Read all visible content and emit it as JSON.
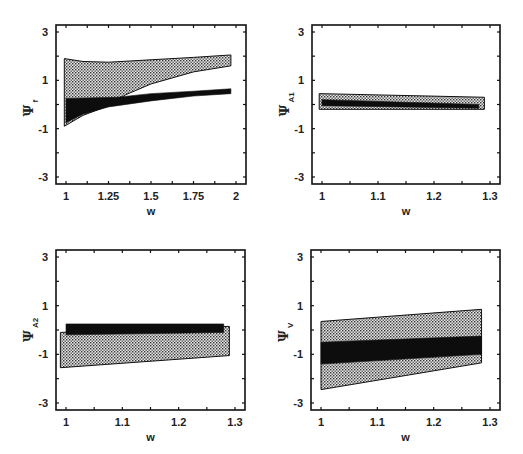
{
  "figure": {
    "panels": [
      {
        "id": "psi_f",
        "ylabel_main": "Ψ",
        "ylabel_sub": "f",
        "xlabel": "w"
      },
      {
        "id": "psi_A1",
        "ylabel_main": "Ψ",
        "ylabel_sub": "A1",
        "xlabel": "w"
      },
      {
        "id": "psi_A2",
        "ylabel_main": "Ψ",
        "ylabel_sub": "A2",
        "xlabel": "w"
      },
      {
        "id": "psi_V",
        "ylabel_main": "Ψ",
        "ylabel_sub": "V",
        "xlabel": "w"
      }
    ]
  },
  "chart_data": [
    {
      "type": "area",
      "title": "",
      "xlabel": "w",
      "ylabel": "Ψ_f",
      "xlim": [
        0.97,
        2.05
      ],
      "ylim": [
        -3.3,
        3.3
      ],
      "xticks": [
        1,
        1.25,
        1.5,
        1.75,
        2
      ],
      "xtick_labels": [
        "1",
        "1.25",
        "1.5",
        "1.75",
        "2"
      ],
      "yticks": [
        3,
        1,
        -1,
        -3
      ],
      "ytick_labels": [
        "3",
        "1",
        "-1",
        "-3"
      ],
      "grid": false,
      "series": [
        {
          "name": "hatched region (light)",
          "fill": "stippled",
          "upper": [
            [
              0.99,
              1.9
            ],
            [
              1.1,
              1.78
            ],
            [
              1.25,
              1.75
            ],
            [
              1.5,
              1.85
            ],
            [
              1.75,
              1.95
            ],
            [
              1.97,
              2.05
            ]
          ],
          "lower": [
            [
              0.99,
              -0.9
            ],
            [
              1.1,
              -0.45
            ],
            [
              1.25,
              -0.05
            ],
            [
              1.35,
              0.4
            ],
            [
              1.5,
              0.85
            ],
            [
              1.75,
              1.35
            ],
            [
              1.97,
              1.6
            ]
          ]
        },
        {
          "name": "dark region",
          "fill": "solid-black",
          "upper": [
            [
              1.0,
              0.25
            ],
            [
              1.3,
              0.3
            ],
            [
              1.5,
              0.45
            ],
            [
              1.75,
              0.55
            ],
            [
              1.97,
              0.65
            ]
          ],
          "lower": [
            [
              1.0,
              -0.75
            ],
            [
              1.1,
              -0.4
            ],
            [
              1.25,
              -0.1
            ],
            [
              1.5,
              0.15
            ],
            [
              1.75,
              0.35
            ],
            [
              1.97,
              0.45
            ]
          ]
        }
      ]
    },
    {
      "type": "area",
      "title": "",
      "xlabel": "w",
      "ylabel": "Ψ_A1",
      "xlim": [
        0.99,
        1.31
      ],
      "ylim": [
        -3.3,
        3.3
      ],
      "xticks": [
        1,
        1.1,
        1.2,
        1.3
      ],
      "xtick_labels": [
        "1",
        "1.1",
        "1.2",
        "1.3"
      ],
      "yticks": [
        3,
        1,
        -1,
        -3
      ],
      "ytick_labels": [
        "3",
        "1",
        "-1",
        "-3"
      ],
      "grid": false,
      "series": [
        {
          "name": "hatched region (light)",
          "fill": "stippled",
          "upper": [
            [
              0.995,
              0.45
            ],
            [
              1.29,
              0.3
            ]
          ],
          "lower": [
            [
              0.995,
              -0.2
            ],
            [
              1.29,
              -0.2
            ]
          ]
        },
        {
          "name": "dark region",
          "fill": "solid-black",
          "upper": [
            [
              1.0,
              0.2
            ],
            [
              1.28,
              0.0
            ]
          ],
          "lower": [
            [
              1.0,
              -0.05
            ],
            [
              1.28,
              -0.15
            ]
          ]
        }
      ]
    },
    {
      "type": "area",
      "title": "",
      "xlabel": "w",
      "ylabel": "Ψ_A2",
      "xlim": [
        0.99,
        1.31
      ],
      "ylim": [
        -3.3,
        3.3
      ],
      "xticks": [
        1,
        1.1,
        1.2,
        1.3
      ],
      "xtick_labels": [
        "1",
        "1.1",
        "1.2",
        "1.3"
      ],
      "yticks": [
        3,
        1,
        -1,
        -3
      ],
      "ytick_labels": [
        "3",
        "1",
        "-1",
        "-3"
      ],
      "grid": false,
      "series": [
        {
          "name": "hatched region (light)",
          "fill": "stippled",
          "upper": [
            [
              0.99,
              -0.1
            ],
            [
              1.29,
              0.15
            ]
          ],
          "lower": [
            [
              0.99,
              -1.55
            ],
            [
              1.29,
              -1.05
            ]
          ]
        },
        {
          "name": "dark region",
          "fill": "solid-black",
          "upper": [
            [
              1.0,
              0.25
            ],
            [
              1.28,
              0.25
            ]
          ],
          "lower": [
            [
              1.0,
              -0.2
            ],
            [
              1.28,
              -0.1
            ]
          ]
        }
      ]
    },
    {
      "type": "area",
      "title": "",
      "xlabel": "w",
      "ylabel": "Ψ_V",
      "xlim": [
        0.99,
        1.31
      ],
      "ylim": [
        -3.3,
        3.3
      ],
      "xticks": [
        1,
        1.1,
        1.2,
        1.3
      ],
      "xtick_labels": [
        "1",
        "1.1",
        "1.2",
        "1.3"
      ],
      "yticks": [
        3,
        1,
        -1,
        -3
      ],
      "ytick_labels": [
        "3",
        "1",
        "-1",
        "-3"
      ],
      "grid": false,
      "series": [
        {
          "name": "hatched region (light)",
          "fill": "stippled",
          "upper": [
            [
              1.0,
              0.35
            ],
            [
              1.285,
              0.85
            ]
          ],
          "lower": [
            [
              1.0,
              -2.45
            ],
            [
              1.285,
              -1.35
            ]
          ]
        },
        {
          "name": "dark region",
          "fill": "solid-black",
          "upper": [
            [
              1.0,
              -0.5
            ],
            [
              1.285,
              -0.25
            ]
          ],
          "lower": [
            [
              1.0,
              -1.4
            ],
            [
              1.285,
              -1.0
            ]
          ]
        }
      ]
    }
  ]
}
